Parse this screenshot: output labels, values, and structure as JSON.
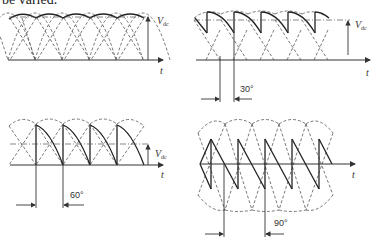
{
  "caption": "be varied.",
  "panels": [
    {
      "id": "alpha-0",
      "vdc_label": "V",
      "vdc_sub": "dc",
      "time_label": "t",
      "angle_label": ""
    },
    {
      "id": "alpha-30",
      "vdc_label": "V",
      "vdc_sub": "dc",
      "time_label": "t",
      "angle_label": "30°"
    },
    {
      "id": "alpha-60",
      "vdc_label": "V",
      "vdc_sub": "dc",
      "time_label": "t",
      "angle_label": "60°"
    },
    {
      "id": "alpha-90",
      "vdc_label": "",
      "vdc_sub": "",
      "time_label": "t",
      "angle_label": "90°"
    }
  ],
  "colors": {
    "stroke": "#333333",
    "dashed": "#555555"
  }
}
